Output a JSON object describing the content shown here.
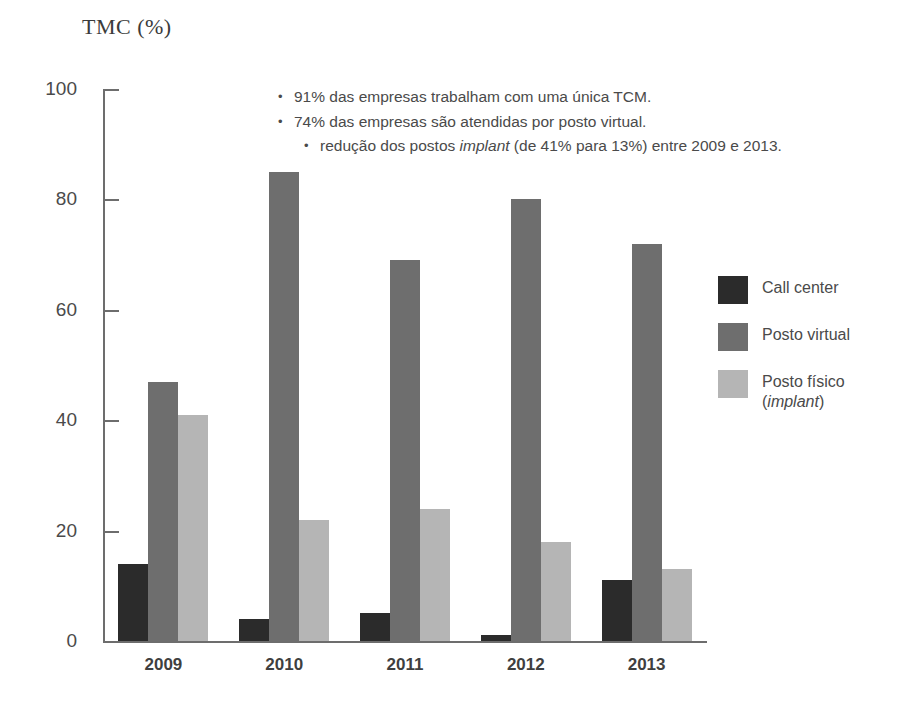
{
  "chart_data": {
    "type": "bar",
    "title": "TMC (%)",
    "xlabel": "",
    "ylabel": "TMC (%)",
    "categories": [
      "2009",
      "2010",
      "2011",
      "2012",
      "2013"
    ],
    "series": [
      {
        "name": "Call center",
        "color": "#2b2b2b",
        "values": [
          14,
          4,
          5,
          1,
          11
        ]
      },
      {
        "name": "Posto virtual",
        "color": "#6e6e6e",
        "values": [
          47,
          85,
          69,
          80,
          72
        ]
      },
      {
        "name": "Posto físico (implant)",
        "color": "#b5b5b5",
        "values": [
          41,
          22,
          24,
          18,
          13
        ]
      }
    ],
    "ylim": [
      0,
      100
    ],
    "yticks": [
      0,
      20,
      40,
      60,
      80,
      100
    ],
    "grid": false,
    "legend_position": "right",
    "annotations": [
      "91% das empresas trabalham com uma única TCM.",
      "74% das empresas são atendidas por posto virtual.",
      "redução dos postos implant (de 41% para 13%) entre 2009 e 2013."
    ]
  },
  "axis": {
    "ytick_labels": [
      "100",
      "80",
      "60",
      "40",
      "20",
      "0"
    ]
  },
  "legend": {
    "items": [
      {
        "label": "Call center"
      },
      {
        "label": "Posto virtual"
      },
      {
        "label": "Posto físico\n(implant)"
      }
    ]
  },
  "annotations": {
    "bullet_glyph": "•",
    "lines": [
      {
        "pre": "91% das empresas trabalham com uma única TCM.",
        "em": "",
        "post": ""
      },
      {
        "pre": "74% das empresas são atendidas por posto virtual.",
        "em": "",
        "post": ""
      },
      {
        "pre": "redução dos postos ",
        "em": "implant",
        "post": " (de 41% para 13%) entre 2009 e 2013."
      }
    ]
  }
}
